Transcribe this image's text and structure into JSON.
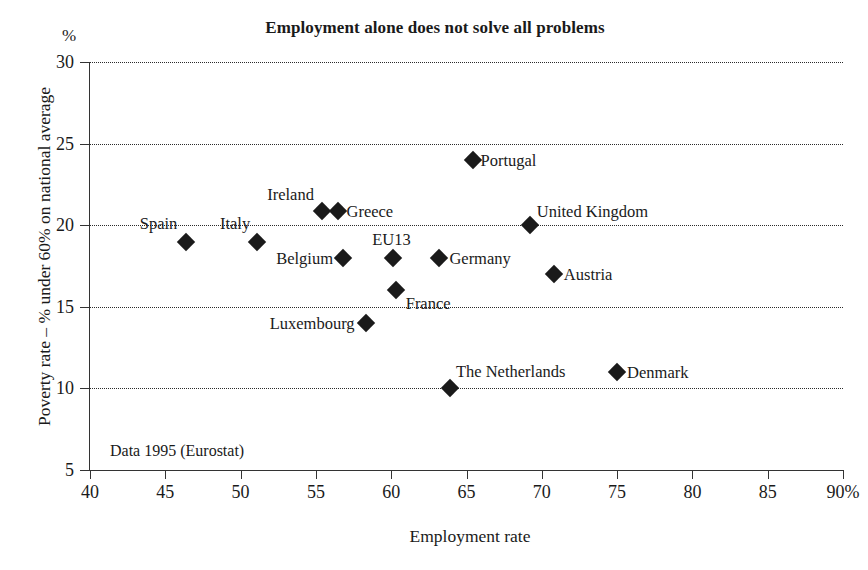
{
  "chart_data": {
    "type": "scatter",
    "title": "Employment alone does not solve all problems",
    "xlabel": "Employment rate",
    "ylabel": "Poverty rate – % under 60% on national average",
    "y_unit": "%",
    "x_unit_suffix": "%",
    "annotation": "Data 1995 (Eurostat)",
    "xlim": [
      40,
      90
    ],
    "ylim": [
      5,
      30
    ],
    "grid": "horizontal-dotted",
    "legend": "none",
    "x_ticks": [
      "40",
      "45",
      "50",
      "55",
      "60",
      "65",
      "70",
      "75",
      "80",
      "85",
      "90%"
    ],
    "x_tick_values": [
      40,
      45,
      50,
      55,
      60,
      65,
      70,
      75,
      80,
      85,
      90
    ],
    "y_ticks": [
      "5",
      "10",
      "15",
      "20",
      "25",
      "30"
    ],
    "y_tick_values": [
      5,
      10,
      15,
      20,
      25,
      30
    ],
    "marker": "filled-diamond",
    "marker_color": "#1a1a1a",
    "points": [
      {
        "name": "Spain",
        "x": 46.4,
        "y": 19.0,
        "label_side": "left",
        "label_dx": -9,
        "label_dy": -19
      },
      {
        "name": "Italy",
        "x": 51.1,
        "y": 19.0,
        "label_side": "left",
        "label_dx": -7,
        "label_dy": -19
      },
      {
        "name": "Ireland",
        "x": 55.4,
        "y": 20.9,
        "label_side": "left",
        "label_dx": -8,
        "label_dy": -17
      },
      {
        "name": "Greece",
        "x": 56.5,
        "y": 20.9,
        "label_side": "right",
        "label_dx": 8,
        "label_dy": 0
      },
      {
        "name": "Belgium",
        "x": 56.8,
        "y": 18.0,
        "label_side": "left",
        "label_dx": -10,
        "label_dy": 0
      },
      {
        "name": "EU13",
        "x": 60.1,
        "y": 18.0,
        "label_side": "left",
        "label_dx": 18,
        "label_dy": -19
      },
      {
        "name": "Germany",
        "x": 63.2,
        "y": 18.0,
        "label_side": "right",
        "label_dx": 10,
        "label_dy": 0
      },
      {
        "name": "France",
        "x": 60.3,
        "y": 16.0,
        "label_side": "right",
        "label_dx": 10,
        "label_dy": 13
      },
      {
        "name": "Luxembourg",
        "x": 58.3,
        "y": 14.0,
        "label_side": "left",
        "label_dx": -11,
        "label_dy": 0
      },
      {
        "name": "Portugal",
        "x": 65.4,
        "y": 24.0,
        "label_side": "right",
        "label_dx": 8,
        "label_dy": 0
      },
      {
        "name": "United Kingdom",
        "x": 69.2,
        "y": 20.0,
        "label_side": "right",
        "label_dx": 7,
        "label_dy": -14
      },
      {
        "name": "Austria",
        "x": 70.8,
        "y": 17.0,
        "label_side": "right",
        "label_dx": 10,
        "label_dy": 0
      },
      {
        "name": "The Netherlands",
        "x": 63.9,
        "y": 10.0,
        "label_side": "right",
        "label_dx": 6,
        "label_dy": -17
      },
      {
        "name": "Denmark",
        "x": 75.0,
        "y": 11.0,
        "label_side": "right",
        "label_dx": 10,
        "label_dy": 0
      }
    ]
  }
}
